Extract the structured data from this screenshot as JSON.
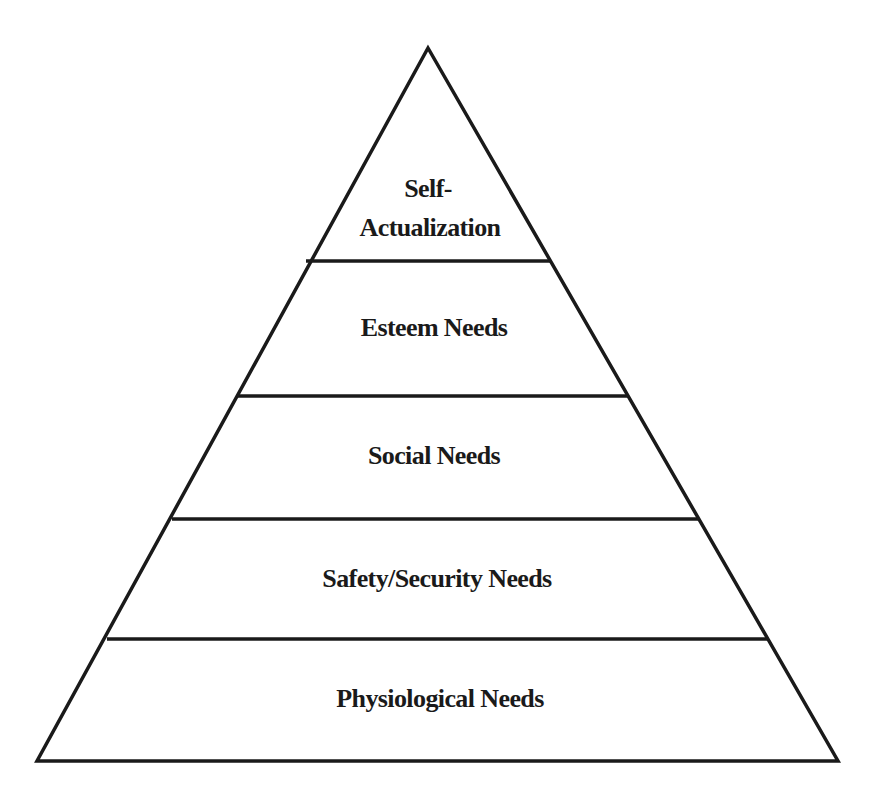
{
  "diagram": {
    "type": "pyramid",
    "title": "",
    "stroke_color": "#1a1a1a",
    "fill_color": "#ffffff",
    "levels_top_to_bottom": [
      {
        "id": "self-actualization",
        "lines": [
          "Self-",
          "Actualization"
        ]
      },
      {
        "id": "esteem",
        "lines": [
          "Esteem Needs"
        ]
      },
      {
        "id": "social",
        "lines": [
          "Social Needs"
        ]
      },
      {
        "id": "safety",
        "lines": [
          "Safety/Security Needs"
        ]
      },
      {
        "id": "physiological",
        "lines": [
          "Physiological Needs"
        ]
      }
    ]
  }
}
